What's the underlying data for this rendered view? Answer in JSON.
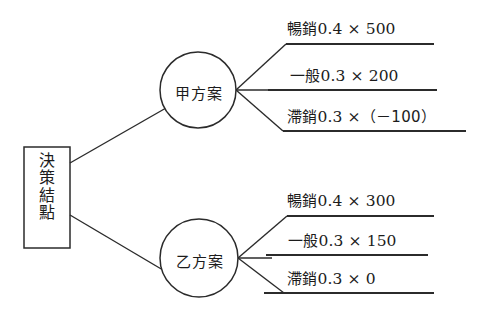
{
  "diagram": {
    "type": "decision-tree",
    "root": {
      "label_chars": [
        "決",
        "策",
        "結",
        "點"
      ],
      "label": "決策結點"
    },
    "nodes": [
      {
        "id": "plan-a",
        "label": "甲方案",
        "branches": [
          {
            "id": "a-best",
            "condition": "暢銷",
            "probability": "0.4",
            "times": "×",
            "payoff": "500",
            "text_cjk": "暢銷",
            "text_num": "0.4 × 500"
          },
          {
            "id": "a-average",
            "condition": "一般",
            "probability": "0.3",
            "times": "×",
            "payoff": "200",
            "text_cjk": "一般",
            "text_num": "0.3 × 200"
          },
          {
            "id": "a-slow",
            "condition": "滯銷",
            "probability": "0.3",
            "times": "×",
            "payoff": "（－100）",
            "text_cjk": "滯銷",
            "text_num": "0.3 ×",
            "text_tail": "（－100）"
          }
        ]
      },
      {
        "id": "plan-b",
        "label": "乙方案",
        "branches": [
          {
            "id": "b-best",
            "condition": "暢銷",
            "probability": "0.4",
            "times": "×",
            "payoff": "300",
            "text_cjk": "暢銷",
            "text_num": "0.4 × 300"
          },
          {
            "id": "b-average",
            "condition": "一般",
            "probability": "0.3",
            "times": "×",
            "payoff": "150",
            "text_cjk": "一般",
            "text_num": "0.3 × 150"
          },
          {
            "id": "b-slow",
            "condition": "滯銷",
            "probability": "0.3",
            "times": "×",
            "payoff": "0",
            "text_cjk": "滯銷",
            "text_num": "0.3 × 0"
          }
        ]
      }
    ],
    "colors": {
      "line": "#2b2b2b",
      "text": "#1c1c1c",
      "background": "#ffffff"
    }
  }
}
